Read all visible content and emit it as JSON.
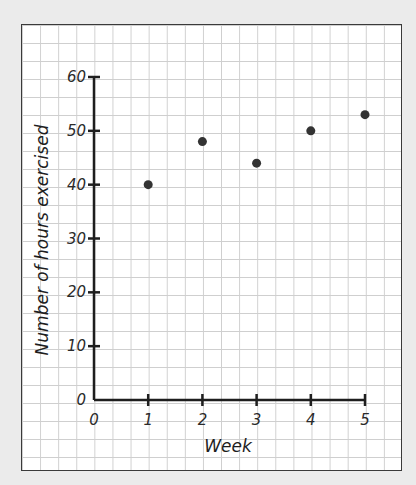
{
  "chart_data": {
    "type": "scatter",
    "title": "",
    "xlabel": "Week",
    "ylabel": "Number of hours exercised",
    "x": [
      1,
      2,
      3,
      4,
      5
    ],
    "values": [
      40,
      48,
      44,
      50,
      53
    ],
    "series": [
      {
        "name": "Hours exercised",
        "x": [
          1,
          2,
          3,
          4,
          5
        ],
        "values": [
          40,
          48,
          44,
          50,
          53
        ]
      }
    ],
    "xlim": [
      0,
      5
    ],
    "ylim": [
      0,
      60
    ],
    "x_ticks": [
      "0",
      "1",
      "2",
      "3",
      "4",
      "5"
    ],
    "y_ticks": [
      "0",
      "10",
      "20",
      "30",
      "40",
      "50",
      "60"
    ],
    "grid": true,
    "legend": null,
    "style": "hand-drawn on graph paper"
  },
  "colors": {
    "background": "#ebebeb",
    "paper": "#ffffff",
    "grid": "#cfcfcf",
    "axis": "#1e1e1e",
    "point": "#333333"
  }
}
